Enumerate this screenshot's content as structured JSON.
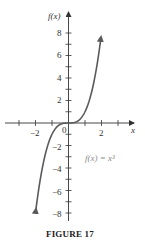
{
  "figure": {
    "caption": "FIGURE 17",
    "function_label": "f(x) = x³"
  },
  "colors": {
    "axis": "#333333",
    "curve": "#5a5a5a",
    "function_label": "#8a8a8a"
  },
  "chart_data": {
    "type": "line",
    "title": "",
    "xlabel": "x",
    "ylabel": "f(x)",
    "xlim": [
      -3,
      4
    ],
    "ylim": [
      -9,
      9
    ],
    "x_ticks": [
      -3,
      -2,
      -1,
      0,
      1,
      2,
      3
    ],
    "x_tick_labels": [
      "−2",
      "0",
      "2"
    ],
    "y_ticks": [
      -8,
      -7,
      -6,
      -5,
      -4,
      -3,
      -2,
      -1,
      1,
      2,
      3,
      4,
      5,
      6,
      7,
      8
    ],
    "y_tick_labels": [
      "8",
      "6",
      "4",
      "2",
      "−2",
      "−4",
      "−6",
      "−8"
    ],
    "grid": false,
    "legend": null,
    "annotations": [
      {
        "text": "f(x) = x³",
        "x": 2.3,
        "y": -3
      }
    ],
    "series": [
      {
        "name": "f(x) = x³",
        "x": [
          -2,
          -1.75,
          -1.5,
          -1.25,
          -1,
          -0.75,
          -0.5,
          -0.25,
          0,
          0.25,
          0.5,
          0.75,
          1,
          1.25,
          1.5,
          1.75,
          2
        ],
        "values": [
          -8,
          -5.36,
          -3.375,
          -1.95,
          -1,
          -0.42,
          -0.125,
          -0.016,
          0,
          0.016,
          0.125,
          0.42,
          1,
          1.95,
          3.375,
          5.36,
          8
        ]
      }
    ]
  }
}
